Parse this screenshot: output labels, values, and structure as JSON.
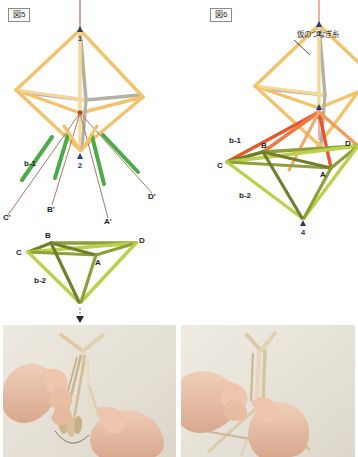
{
  "page": {
    "language": "ja"
  },
  "colors": {
    "straw_tan": "#f2c36b",
    "straw_tan_light": "#f6d79a",
    "straw_gray": "#b3b0a6",
    "straw_green": "#4aab48",
    "straw_olive": "#7f8f33",
    "straw_yellowgreen": "#bcd04a",
    "straw_orange": "#e8562a",
    "straw_orange_light": "#f59b5a",
    "thread_red": "#c0392b",
    "thread_brown": "#9c6b4f",
    "marker_navy": "#2b3a77",
    "text": "#231f20",
    "dash_gray": "#8b8b8b",
    "photo_bg": "#e9e4da"
  },
  "figures": [
    {
      "id": "fig5",
      "label": "図5",
      "upper_shape": {
        "name": "octahedron-frame",
        "apex_marker": "1"
      },
      "middle_marker": "2",
      "side_labels": [
        "b-1"
      ],
      "leg_labels": [
        "C'",
        "B'",
        "A'",
        "D'"
      ],
      "lower_shape": {
        "name": "lower-pyramid",
        "vertex_labels": [
          "B",
          "C",
          "D",
          "A"
        ],
        "side_label": "b-2",
        "corner_extra_label": "A'"
      },
      "arrow": {
        "name": "down-dashed-arrow",
        "style": "dashed"
      }
    },
    {
      "id": "fig6",
      "label": "図6",
      "callout": {
        "text": "仮のつなぎ糸",
        "leader": "diagonal-line"
      },
      "upper_shape": {
        "name": "octahedron-frame",
        "apex_marker": "1"
      },
      "middle_marker": "3",
      "bottom_marker": "4",
      "side_labels": [
        "b-1",
        "b-2"
      ],
      "vertex_labels": [
        "B",
        "C",
        "D",
        "A"
      ]
    }
  ],
  "photos": [
    {
      "id": "photo-left",
      "alt": "両手でストローと糸を束ねているところ",
      "name": "photo-assembling-strands"
    },
    {
      "id": "photo-right",
      "alt": "両手でストロー構造の頂点を結んでいるところ",
      "name": "photo-tying-apex"
    }
  ]
}
